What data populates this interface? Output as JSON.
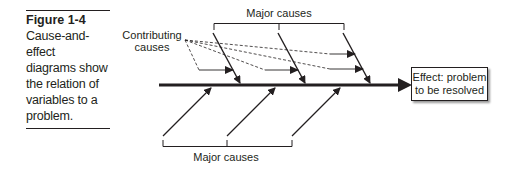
{
  "caption": {
    "figure_label": "Figure 1-4",
    "text_lines": [
      "Cause-and-effect",
      "diagrams show",
      "the relation of",
      "variables to a",
      "problem."
    ]
  },
  "diagram": {
    "type": "fishbone",
    "top_bracket_label": "Major causes",
    "bottom_bracket_label": "Major causes",
    "contributing_label_line1": "Contributing",
    "contributing_label_line2": "causes",
    "effect_line1": "Effect: problem",
    "effect_line2": "to be resolved",
    "top_major_causes_count": 3,
    "bottom_major_causes_count": 3,
    "contributing_arrows_count": 4,
    "line_color": "#231f20"
  }
}
